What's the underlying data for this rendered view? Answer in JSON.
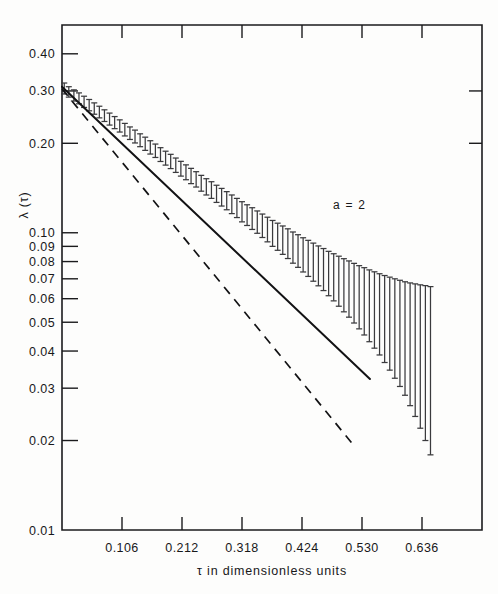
{
  "figure": {
    "annotation": "a = 2",
    "ylabel": "λ (τ)",
    "xlabel": "τ in dimensionless units"
  },
  "chart_data": {
    "type": "scatter",
    "title": "",
    "xlabel": "τ in dimensionless units",
    "ylabel": "λ (τ)",
    "yscale": "log",
    "xscale": "linear",
    "grid": false,
    "legend": null,
    "annotations": [
      {
        "text": "a = 2",
        "x": 0.4,
        "y": 0.135
      }
    ],
    "xlim": [
      0.0,
      0.742
    ],
    "ylim": [
      0.01,
      0.5
    ],
    "xticks": [
      0.106,
      0.212,
      0.318,
      0.424,
      0.53,
      0.636
    ],
    "xtick_labels": [
      "0.106",
      "0.212",
      "0.318",
      "0.424",
      "0.530",
      "0.636"
    ],
    "yticks": [
      0.4,
      0.3,
      0.2,
      0.1,
      0.09,
      0.08,
      0.07,
      0.06,
      0.05,
      0.04,
      0.03,
      0.02,
      0.01
    ],
    "ytick_labels": [
      "0.40",
      "0.30",
      "0.20",
      "0.10",
      "0.09",
      "0.08",
      "0.07",
      "0.06",
      "0.05",
      "0.04",
      "0.03",
      "0.02",
      "0.01"
    ],
    "series": [
      {
        "name": "fit-line-solid",
        "type": "line",
        "style": "solid",
        "x": [
          0.0,
          0.544
        ],
        "y": [
          0.31,
          0.0322
        ]
      },
      {
        "name": "reference-line-dashed",
        "type": "line",
        "style": "dashed",
        "x": [
          0.0,
          0.516
        ],
        "y": [
          0.305,
          0.0192
        ]
      },
      {
        "name": "measurements",
        "type": "errorbar",
        "points": [
          {
            "x": 0.004,
            "y": 0.306,
            "err": 0.013
          },
          {
            "x": 0.012,
            "y": 0.298,
            "err": 0.012
          },
          {
            "x": 0.021,
            "y": 0.29,
            "err": 0.0125
          },
          {
            "x": 0.03,
            "y": 0.2835,
            "err": 0.012
          },
          {
            "x": 0.039,
            "y": 0.276,
            "err": 0.012
          },
          {
            "x": 0.048,
            "y": 0.269,
            "err": 0.0118
          },
          {
            "x": 0.057,
            "y": 0.262,
            "err": 0.0115
          },
          {
            "x": 0.066,
            "y": 0.255,
            "err": 0.0115
          },
          {
            "x": 0.075,
            "y": 0.248,
            "err": 0.0112
          },
          {
            "x": 0.084,
            "y": 0.2415,
            "err": 0.0112
          },
          {
            "x": 0.093,
            "y": 0.235,
            "err": 0.011
          },
          {
            "x": 0.102,
            "y": 0.229,
            "err": 0.0108
          },
          {
            "x": 0.111,
            "y": 0.2225,
            "err": 0.0108
          },
          {
            "x": 0.12,
            "y": 0.2165,
            "err": 0.0105
          },
          {
            "x": 0.129,
            "y": 0.211,
            "err": 0.0105
          },
          {
            "x": 0.138,
            "y": 0.205,
            "err": 0.0102
          },
          {
            "x": 0.147,
            "y": 0.1995,
            "err": 0.0102
          },
          {
            "x": 0.156,
            "y": 0.194,
            "err": 0.01
          },
          {
            "x": 0.165,
            "y": 0.189,
            "err": 0.0098
          },
          {
            "x": 0.174,
            "y": 0.1835,
            "err": 0.0098
          },
          {
            "x": 0.183,
            "y": 0.1785,
            "err": 0.0096
          },
          {
            "x": 0.192,
            "y": 0.174,
            "err": 0.0096
          },
          {
            "x": 0.201,
            "y": 0.169,
            "err": 0.0094
          },
          {
            "x": 0.21,
            "y": 0.1645,
            "err": 0.0094
          },
          {
            "x": 0.219,
            "y": 0.16,
            "err": 0.0092
          },
          {
            "x": 0.228,
            "y": 0.1555,
            "err": 0.0092
          },
          {
            "x": 0.237,
            "y": 0.1515,
            "err": 0.009
          },
          {
            "x": 0.246,
            "y": 0.147,
            "err": 0.009
          },
          {
            "x": 0.255,
            "y": 0.143,
            "err": 0.009
          },
          {
            "x": 0.264,
            "y": 0.1395,
            "err": 0.009
          },
          {
            "x": 0.273,
            "y": 0.1355,
            "err": 0.009
          },
          {
            "x": 0.282,
            "y": 0.132,
            "err": 0.009
          },
          {
            "x": 0.291,
            "y": 0.1285,
            "err": 0.009
          },
          {
            "x": 0.3,
            "y": 0.125,
            "err": 0.009
          },
          {
            "x": 0.309,
            "y": 0.1215,
            "err": 0.009
          },
          {
            "x": 0.318,
            "y": 0.118,
            "err": 0.0092
          },
          {
            "x": 0.327,
            "y": 0.115,
            "err": 0.0092
          },
          {
            "x": 0.336,
            "y": 0.112,
            "err": 0.0094
          },
          {
            "x": 0.345,
            "y": 0.109,
            "err": 0.0094
          },
          {
            "x": 0.354,
            "y": 0.106,
            "err": 0.0096
          },
          {
            "x": 0.363,
            "y": 0.103,
            "err": 0.0098
          },
          {
            "x": 0.372,
            "y": 0.1,
            "err": 0.01
          },
          {
            "x": 0.381,
            "y": 0.0975,
            "err": 0.0102
          },
          {
            "x": 0.39,
            "y": 0.095,
            "err": 0.0104
          },
          {
            "x": 0.399,
            "y": 0.0925,
            "err": 0.0106
          },
          {
            "x": 0.408,
            "y": 0.0898,
            "err": 0.0108
          },
          {
            "x": 0.417,
            "y": 0.0875,
            "err": 0.011
          },
          {
            "x": 0.426,
            "y": 0.085,
            "err": 0.0112
          },
          {
            "x": 0.435,
            "y": 0.0828,
            "err": 0.0115
          },
          {
            "x": 0.444,
            "y": 0.0805,
            "err": 0.0118
          },
          {
            "x": 0.453,
            "y": 0.0783,
            "err": 0.012
          },
          {
            "x": 0.462,
            "y": 0.0762,
            "err": 0.0123
          },
          {
            "x": 0.471,
            "y": 0.074,
            "err": 0.0126
          },
          {
            "x": 0.48,
            "y": 0.072,
            "err": 0.013
          },
          {
            "x": 0.489,
            "y": 0.07,
            "err": 0.0134
          },
          {
            "x": 0.498,
            "y": 0.068,
            "err": 0.0138
          },
          {
            "x": 0.507,
            "y": 0.0662,
            "err": 0.0142
          },
          {
            "x": 0.516,
            "y": 0.0643,
            "err": 0.0146
          },
          {
            "x": 0.525,
            "y": 0.0625,
            "err": 0.015
          },
          {
            "x": 0.534,
            "y": 0.0608,
            "err": 0.0155
          },
          {
            "x": 0.543,
            "y": 0.059,
            "err": 0.016
          },
          {
            "x": 0.552,
            "y": 0.0574,
            "err": 0.0165
          },
          {
            "x": 0.561,
            "y": 0.0558,
            "err": 0.017
          },
          {
            "x": 0.57,
            "y": 0.0542,
            "err": 0.0176
          },
          {
            "x": 0.579,
            "y": 0.0527,
            "err": 0.0182
          },
          {
            "x": 0.588,
            "y": 0.0512,
            "err": 0.0188
          },
          {
            "x": 0.597,
            "y": 0.0498,
            "err": 0.0194
          },
          {
            "x": 0.606,
            "y": 0.0484,
            "err": 0.02
          },
          {
            "x": 0.615,
            "y": 0.047,
            "err": 0.0208
          },
          {
            "x": 0.624,
            "y": 0.0457,
            "err": 0.0216
          },
          {
            "x": 0.633,
            "y": 0.0444,
            "err": 0.0224
          },
          {
            "x": 0.642,
            "y": 0.0432,
            "err": 0.0232
          },
          {
            "x": 0.651,
            "y": 0.0419,
            "err": 0.024
          }
        ]
      }
    ]
  }
}
